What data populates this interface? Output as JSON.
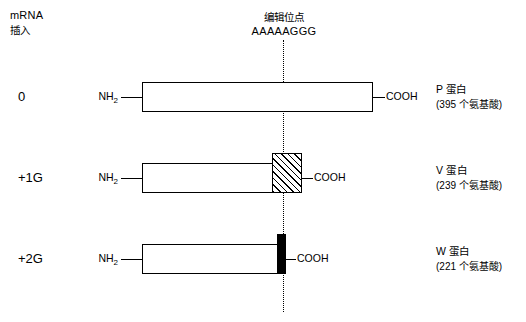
{
  "header": {
    "mrna_line1": "mRNA",
    "mrna_line2": "插入",
    "edit_site_label": "编辑位点",
    "edit_site_sequence": "AAAAAGGG"
  },
  "termini": {
    "n_term": "NH",
    "n_term_sub": "2",
    "c_term": "COOH"
  },
  "rows": [
    {
      "insertion": "0",
      "protein_name": "P 蛋白",
      "protein_length": "(395 个氨基酸)"
    },
    {
      "insertion": "+1G",
      "protein_name": "V 蛋白",
      "protein_length": "(239 个氨基酸)"
    },
    {
      "insertion": "+2G",
      "protein_name": "W 蛋白",
      "protein_length": "(221 个氨基酸)"
    }
  ],
  "colors": {
    "stroke": "#000000",
    "background": "#ffffff",
    "hatch_fill": "#000000",
    "solid_fill": "#000000"
  }
}
